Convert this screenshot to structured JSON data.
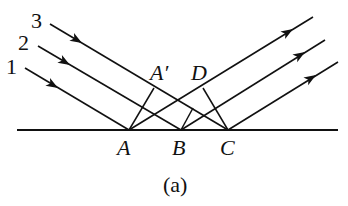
{
  "diagram": {
    "caption": "(a)",
    "ray_labels": [
      "1",
      "2",
      "3"
    ],
    "point_labels": {
      "A": "A",
      "B": "B",
      "C": "C",
      "A_prime": "A′",
      "D": "D"
    },
    "colors": {
      "line": "#111111",
      "background": "#ffffff"
    },
    "geometry": {
      "surface": {
        "x1": 17,
        "y1": 130,
        "x2": 338,
        "y2": 130
      },
      "points": {
        "A": [
          129,
          130
        ],
        "B": [
          181,
          130
        ],
        "C": [
          228,
          130
        ],
        "A_prime": [
          153,
          94
        ],
        "D": [
          203,
          110
        ]
      },
      "incident_rays": [
        {
          "label": "1",
          "from": [
            25,
            68
          ],
          "to": [
            129,
            130
          ]
        },
        {
          "label": "2",
          "from": [
            38,
            46
          ],
          "to": [
            181,
            130
          ]
        },
        {
          "label": "3",
          "from": [
            50,
            24
          ],
          "to": [
            228,
            130
          ]
        }
      ],
      "reflected_rays": [
        {
          "from": [
            129,
            130
          ],
          "to": [
            313,
            17
          ]
        },
        {
          "from": [
            181,
            130
          ],
          "to": [
            325,
            40
          ]
        },
        {
          "from": [
            228,
            130
          ],
          "to": [
            338,
            62
          ]
        }
      ]
    }
  }
}
